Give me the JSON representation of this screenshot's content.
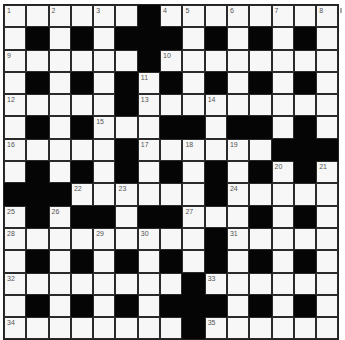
{
  "puzzle": {
    "type": "crossword",
    "rows": 15,
    "cols": 15,
    "grid": [
      "WWWWWWBWWWWWWWW",
      "WBWBWBBBWBWBWBW",
      "WWWWWWBWWWWWWWW",
      "WBWBWBWBWBWBWBW",
      "WWWWWBWWWWWWWWW",
      "WBWBWWWBBWBBWBW",
      "WWWWWBWWWWWWBBB",
      "WBWBWBWBWBWBWBW",
      "BBBWWWWWWBWWWWW",
      "WBWBBWBBWWWBWBW",
      "WWWWWWWWWBWWWWW",
      "WBWBWBWBWBWBWBW",
      "WWWWWWWWBWWWWWW",
      "WBWBWBWBBBWBWBW",
      "WWWWWWWWBWWWWWW"
    ],
    "numbers": [
      {
        "n": "1",
        "r": 0,
        "c": 0
      },
      {
        "n": "2",
        "r": 0,
        "c": 2
      },
      {
        "n": "3",
        "r": 0,
        "c": 4
      },
      {
        "n": "4",
        "r": 0,
        "c": 7
      },
      {
        "n": "5",
        "r": 0,
        "c": 8
      },
      {
        "n": "6",
        "r": 0,
        "c": 10
      },
      {
        "n": "7",
        "r": 0,
        "c": 12
      },
      {
        "n": "8",
        "r": 0,
        "c": 14
      },
      {
        "n": "9",
        "r": 2,
        "c": 0
      },
      {
        "n": "10",
        "r": 2,
        "c": 7
      },
      {
        "n": "11",
        "r": 3,
        "c": 6
      },
      {
        "n": "12",
        "r": 4,
        "c": 0
      },
      {
        "n": "13",
        "r": 4,
        "c": 6
      },
      {
        "n": "14",
        "r": 4,
        "c": 9
      },
      {
        "n": "15",
        "r": 5,
        "c": 4
      },
      {
        "n": "16",
        "r": 6,
        "c": 0
      },
      {
        "n": "17",
        "r": 6,
        "c": 6
      },
      {
        "n": "18",
        "r": 6,
        "c": 8
      },
      {
        "n": "19",
        "r": 6,
        "c": 10
      },
      {
        "n": "20",
        "r": 7,
        "c": 12
      },
      {
        "n": "21",
        "r": 7,
        "c": 14
      },
      {
        "n": "22",
        "r": 8,
        "c": 3
      },
      {
        "n": "23",
        "r": 8,
        "c": 5
      },
      {
        "n": "24",
        "r": 8,
        "c": 10
      },
      {
        "n": "25",
        "r": 9,
        "c": 0
      },
      {
        "n": "26",
        "r": 9,
        "c": 2
      },
      {
        "n": "27",
        "r": 9,
        "c": 8
      },
      {
        "n": "28",
        "r": 10,
        "c": 0
      },
      {
        "n": "29",
        "r": 10,
        "c": 4
      },
      {
        "n": "30",
        "r": 10,
        "c": 6
      },
      {
        "n": "31",
        "r": 10,
        "c": 10
      },
      {
        "n": "32",
        "r": 12,
        "c": 0
      },
      {
        "n": "33",
        "r": 12,
        "c": 9
      },
      {
        "n": "34",
        "r": 14,
        "c": 0
      },
      {
        "n": "35",
        "r": 14,
        "c": 9
      }
    ]
  },
  "colors": {
    "black_cell": "#050505",
    "white_cell": "#f7f7f7",
    "number_text": "#555555"
  }
}
